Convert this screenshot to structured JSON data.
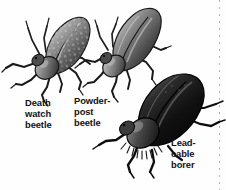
{
  "figure": {
    "background_color": "#fefefe",
    "ink_color": "#121212",
    "width": 226,
    "height": 190,
    "style": "grayscale scientific engraving"
  },
  "labels": {
    "deathwatch": "Death\nwatch\nbeetle",
    "powderpost": "Powder-\npost\nbeetle",
    "leadcable": "Lead-\ncable\nborer"
  },
  "specimens": [
    {
      "id": "death-watch-beetle",
      "common_name": "Death watch beetle",
      "label_lines": [
        "Death",
        "watch",
        "beetle"
      ],
      "tone": "medium gray with mottled speckled elytra",
      "orientation": "head lower-left, abdomen upper-right",
      "position": {
        "x": 8,
        "y": 12,
        "width": 90,
        "height": 95
      }
    },
    {
      "id": "powder-post-beetle",
      "common_name": "Powder-post beetle",
      "label_lines": [
        "Powder-",
        "post",
        "beetle"
      ],
      "tone": "medium-dark gray, smooth elongate elytra",
      "orientation": "head lower-left, abdomen upper-right",
      "position": {
        "x": 82,
        "y": 4,
        "width": 88,
        "height": 96
      }
    },
    {
      "id": "lead-cable-borer",
      "common_name": "Lead-cable borer",
      "label_lines": [
        "Lead-",
        "cable",
        "borer"
      ],
      "tone": "near-black glossy body with hairy pronotum fringe",
      "orientation": "head lower-left, abdomen upper-right",
      "position": {
        "x": 100,
        "y": 72,
        "width": 126,
        "height": 108
      }
    }
  ],
  "decorations": {
    "right_dotted_rule": {
      "name": "dotted-rule",
      "x": 219,
      "color": "#6e6e6e"
    }
  }
}
